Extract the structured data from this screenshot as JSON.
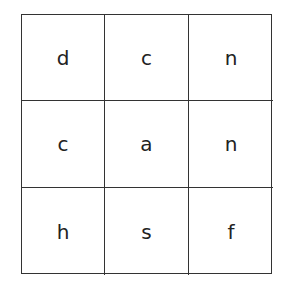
{
  "grid": {
    "rows": 3,
    "cols": 3,
    "cells": [
      [
        "d",
        "c",
        "n"
      ],
      [
        "c",
        "a",
        "n"
      ],
      [
        "h",
        "s",
        "f"
      ]
    ]
  }
}
